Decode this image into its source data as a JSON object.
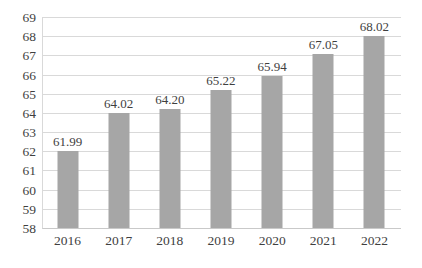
{
  "chart_data": {
    "type": "bar",
    "title": "",
    "subtitle": "",
    "xlabel": "",
    "ylabel": "",
    "categories": [
      "2016",
      "2017",
      "2018",
      "2019",
      "2020",
      "2021",
      "2022"
    ],
    "values": [
      61.99,
      64.02,
      64.2,
      65.22,
      65.94,
      67.05,
      68.02
    ],
    "data_labels": [
      "61.99",
      "64.02",
      "64.20",
      "65.22",
      "65.94",
      "67.05",
      "68.02"
    ],
    "ylim": [
      58,
      69
    ],
    "ytick_labels": [
      "69",
      "68",
      "67",
      "66",
      "65",
      "64",
      "63",
      "62",
      "61",
      "60",
      "59",
      "58"
    ],
    "ytick_values": [
      69,
      68,
      67,
      66,
      65,
      64,
      63,
      62,
      61,
      60,
      59,
      58
    ],
    "ytick_step": 1,
    "grid": {
      "horizontal": true,
      "vertical": false,
      "color": "#d9d9d9"
    },
    "legend": {
      "visible": false,
      "position": "none",
      "entries": []
    },
    "series": [
      {
        "name": "",
        "color": "#a6a6a6",
        "values": [
          61.99,
          64.02,
          64.2,
          65.22,
          65.94,
          67.05,
          68.02
        ]
      }
    ],
    "colors": {
      "bar": "#a6a6a6",
      "grid": "#d9d9d9",
      "axis": "#c9c9c9",
      "text": "#3f3f3f",
      "background": "#ffffff"
    }
  }
}
